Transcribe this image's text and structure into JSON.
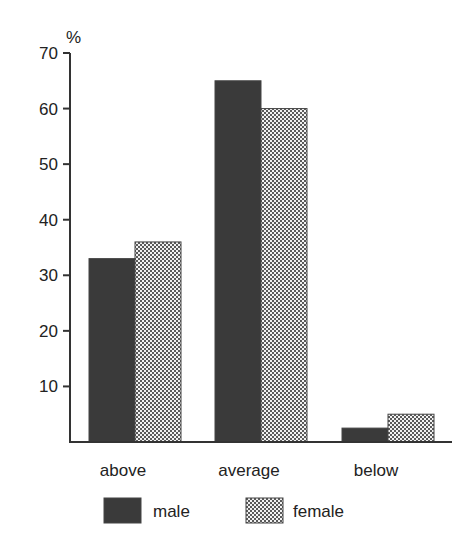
{
  "chart_data": {
    "type": "bar",
    "title": "",
    "xlabel": "",
    "ylabel": "%",
    "ylim": [
      0,
      70
    ],
    "yticks": [
      10,
      20,
      30,
      40,
      50,
      60,
      70
    ],
    "grid": false,
    "legend_position": "bottom",
    "categories": [
      "above",
      "average",
      "below"
    ],
    "series": [
      {
        "name": "male",
        "values": [
          33,
          65,
          2.5
        ],
        "color": "#3a3a3a",
        "pattern": "solid-dark"
      },
      {
        "name": "female",
        "values": [
          36,
          60,
          5
        ],
        "color": "#9a9a9a",
        "pattern": "checkered"
      }
    ]
  }
}
